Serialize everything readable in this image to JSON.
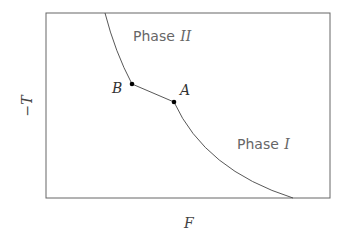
{
  "diagram": {
    "type": "phase-diagram",
    "xlabel": "F",
    "ylabel": "−T",
    "regions": [
      {
        "name": "Phase",
        "numeral": "II"
      },
      {
        "name": "Phase",
        "numeral": "I"
      }
    ],
    "points": [
      {
        "label": "B"
      },
      {
        "label": "A"
      }
    ],
    "colors": {
      "frame": "#555555",
      "curve": "#444444",
      "point": "#000000",
      "text": "#555555"
    }
  }
}
